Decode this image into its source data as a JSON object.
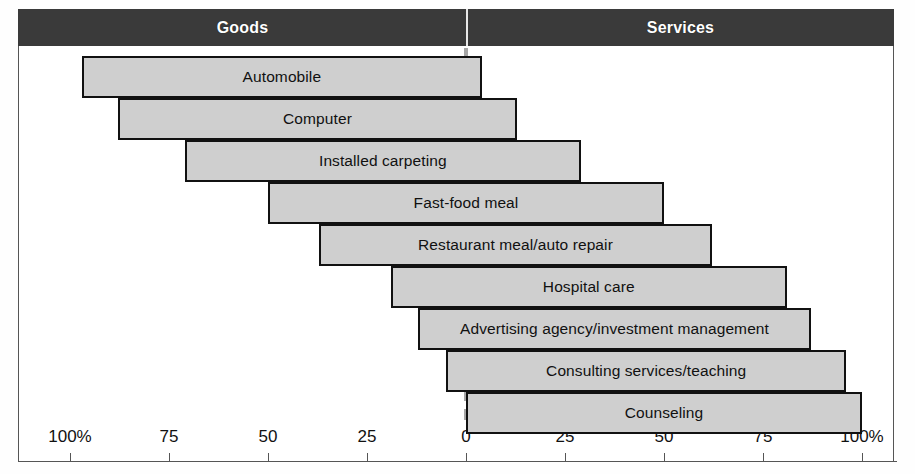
{
  "header": {
    "left_label": "Goods",
    "right_label": "Services",
    "band_color": "#3a3a3a",
    "text_color": "#ffffff"
  },
  "axis": {
    "zero_label": "0",
    "left_ticks": [
      "100%",
      "75",
      "50",
      "25"
    ],
    "right_ticks": [
      "25",
      "50",
      "75",
      "100%"
    ],
    "left_tick_values": [
      100,
      75,
      50,
      25
    ],
    "right_tick_values": [
      25,
      50,
      75,
      100
    ]
  },
  "chart_data": {
    "type": "bar",
    "title": "",
    "subtitle": "",
    "xlabel": "",
    "ylabel": "",
    "orientation": "horizontal-diverging",
    "xlim": [
      -100,
      100
    ],
    "grid": false,
    "legend": [
      "Goods",
      "Services"
    ],
    "legend_position": "top",
    "axis_unit": "percent",
    "zero_reference": 0,
    "categories": [
      "Automobile",
      "Computer",
      "Installed carpeting",
      "Fast-food meal",
      "Restaurant meal/auto repair",
      "Hospital care",
      "Advertising agency/investment management",
      "Consulting services/teaching",
      "Counseling"
    ],
    "series": [
      {
        "name": "Goods",
        "values": [
          97,
          88,
          71,
          50,
          37,
          19,
          12,
          5,
          0
        ]
      },
      {
        "name": "Services",
        "values": [
          4,
          13,
          29,
          50,
          62,
          81,
          87,
          96,
          100
        ]
      }
    ],
    "bars": [
      {
        "label": "Automobile",
        "goods": 97,
        "services": 4
      },
      {
        "label": "Computer",
        "goods": 88,
        "services": 13
      },
      {
        "label": "Installed carpeting",
        "goods": 71,
        "services": 29
      },
      {
        "label": "Fast-food meal",
        "goods": 50,
        "services": 50
      },
      {
        "label": "Restaurant meal/auto repair",
        "goods": 37,
        "services": 62
      },
      {
        "label": "Hospital care",
        "goods": 19,
        "services": 81
      },
      {
        "label": "Advertising agency/investment management",
        "goods": 12,
        "services": 87
      },
      {
        "label": "Consulting services/teaching",
        "goods": 5,
        "services": 96
      },
      {
        "label": "Counseling",
        "goods": 0,
        "services": 100
      }
    ],
    "bar_fill_color": "#cfcfcf",
    "bar_border_color": "#111111",
    "zero_line_color": "#a6a6a6"
  }
}
